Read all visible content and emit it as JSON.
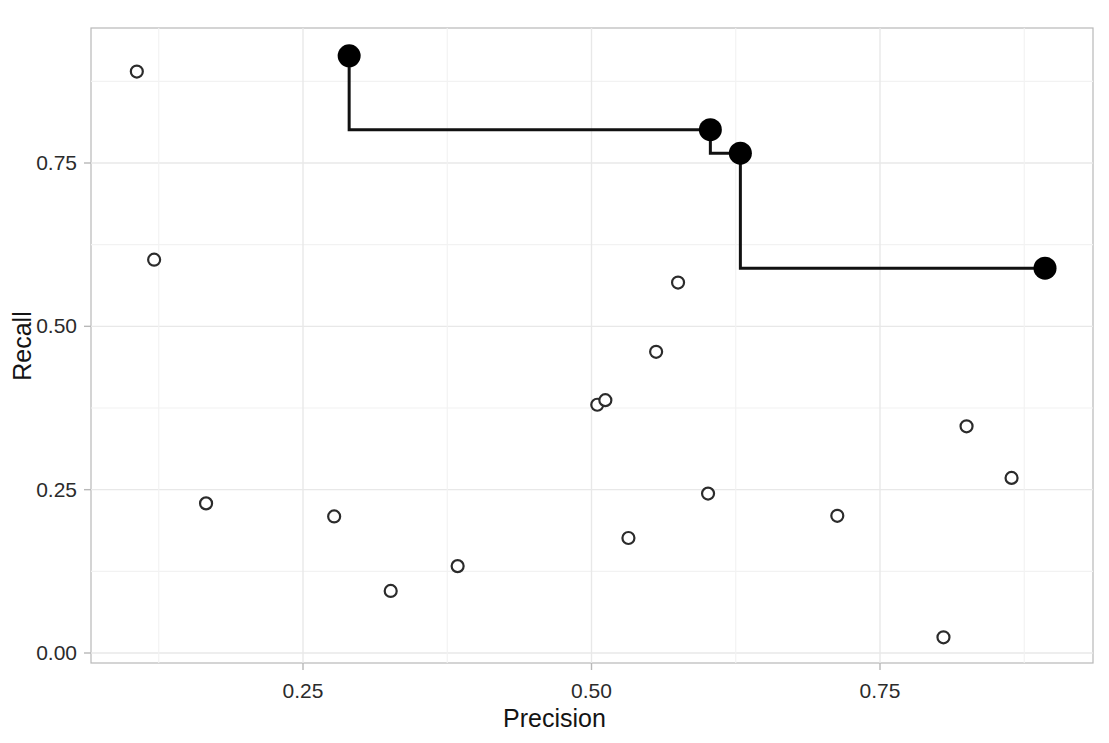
{
  "chart_data": {
    "type": "scatter",
    "title": "",
    "xlabel": "Precision",
    "ylabel": "Recall",
    "xlim": [
      0.08,
      0.92
    ],
    "ylim": [
      -0.02,
      0.94
    ],
    "xticks": [
      0.25,
      0.5,
      0.75
    ],
    "xticklabels": [
      "0.25",
      "0.50",
      "0.75"
    ],
    "yticks": [
      0.0,
      0.25,
      0.5,
      0.75
    ],
    "yticklabels": [
      "0.00",
      "0.25",
      "0.50",
      "0.75"
    ],
    "grid": true,
    "legend": "none",
    "series": [
      {
        "name": "all-points",
        "marker": "open-circle",
        "color": "#2b2b2b",
        "points": [
          {
            "x": 0.106,
            "y": 0.89
          },
          {
            "x": 0.121,
            "y": 0.602
          },
          {
            "x": 0.166,
            "y": 0.229
          },
          {
            "x": 0.277,
            "y": 0.209
          },
          {
            "x": 0.326,
            "y": 0.095
          },
          {
            "x": 0.384,
            "y": 0.133
          },
          {
            "x": 0.505,
            "y": 0.38
          },
          {
            "x": 0.512,
            "y": 0.387
          },
          {
            "x": 0.532,
            "y": 0.176
          },
          {
            "x": 0.556,
            "y": 0.461
          },
          {
            "x": 0.575,
            "y": 0.567
          },
          {
            "x": 0.601,
            "y": 0.244
          },
          {
            "x": 0.713,
            "y": 0.21
          },
          {
            "x": 0.805,
            "y": 0.024
          },
          {
            "x": 0.825,
            "y": 0.347
          },
          {
            "x": 0.864,
            "y": 0.268
          }
        ]
      },
      {
        "name": "pareto-front",
        "marker": "filled-circle",
        "color": "#000000",
        "points": [
          {
            "x": 0.29,
            "y": 0.914
          },
          {
            "x": 0.603,
            "y": 0.801
          },
          {
            "x": 0.629,
            "y": 0.765
          },
          {
            "x": 0.893,
            "y": 0.589
          }
        ],
        "step_line": {
          "style": "step-hv",
          "width": 3,
          "color": "#111111"
        }
      }
    ]
  },
  "axes": {
    "x_title": "Precision",
    "y_title": "Recall",
    "x_tick_labels": [
      "0.25",
      "0.50",
      "0.75"
    ],
    "y_tick_labels": [
      "0.00",
      "0.25",
      "0.50",
      "0.75"
    ]
  },
  "style": {
    "panel_background": "#ffffff",
    "grid_color": "#e8e8e8",
    "axis_color": "#b8b8b8",
    "text_color": "#2b2b2b",
    "marker_open_color": "#2b2b2b",
    "marker_filled_color": "#000000"
  }
}
